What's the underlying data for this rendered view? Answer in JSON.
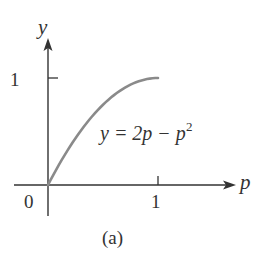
{
  "chart_data": {
    "type": "line",
    "title": "",
    "caption": "(a)",
    "xlabel": "p",
    "ylabel": "y",
    "xlim": [
      0,
      1
    ],
    "ylim": [
      0,
      1
    ],
    "grid": false,
    "legend": null,
    "x_ticks": [
      "0",
      "1"
    ],
    "y_ticks": [
      "1"
    ],
    "annotations": [
      {
        "text": "y = 2p − p²",
        "position": "right of curve, mid-height"
      }
    ],
    "series": [
      {
        "name": "y = 2p − p^2",
        "function": "y = 2p - p^2",
        "x": [
          0,
          0.1,
          0.2,
          0.3,
          0.4,
          0.5,
          0.6,
          0.7,
          0.8,
          0.9,
          1.0
        ],
        "values": [
          0,
          0.19,
          0.36,
          0.51,
          0.64,
          0.75,
          0.84,
          0.91,
          0.96,
          0.99,
          1.0
        ]
      }
    ],
    "colors": {
      "curve": "#8a8a8a",
      "axes": "#333333"
    }
  },
  "labels": {
    "y_axis": "y",
    "x_axis": "p",
    "y_tick_1": "1",
    "x_tick_0": "0",
    "x_tick_1": "1",
    "equation_lhs": "y = 2p − p",
    "equation_exp": "2",
    "caption": "(a)"
  }
}
